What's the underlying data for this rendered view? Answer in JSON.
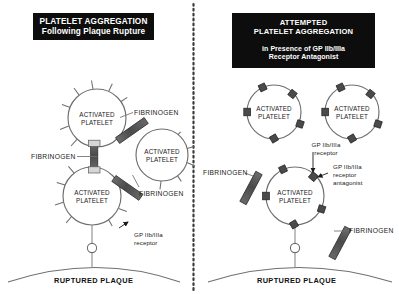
{
  "figure": {
    "divider": "vertical-dotted-line"
  },
  "panels": {
    "left": {
      "banner": {
        "line1": "PLATELET AGGREGATION",
        "line2": "Following Plaque Rupture"
      },
      "platelets": [
        {
          "id": "left-top",
          "label_line1": "ACTIVATED",
          "label_line2": "PLATELET",
          "cx": 97,
          "cy": 118,
          "r": 29
        },
        {
          "id": "left-right",
          "label_line1": "ACTIVATED",
          "label_line2": "PLATELET",
          "cx": 162,
          "cy": 155,
          "r": 26
        },
        {
          "id": "left-bottom",
          "label_line1": "ACTIVATED",
          "label_line2": "PLATELET",
          "cx": 92,
          "cy": 196,
          "r": 29
        }
      ],
      "fibrinogen_labels": [
        {
          "id": "fib-top-right",
          "text": "FIBRINOGEN",
          "x": 122,
          "y": 112
        },
        {
          "id": "fib-left",
          "text": "FIBRINOGEN",
          "x": 31,
          "y": 151
        },
        {
          "id": "fib-bottom",
          "text": "FIBRINOGEN",
          "x": 122,
          "y": 192
        }
      ],
      "receptor_label": {
        "line1": "GP IIb/IIIa",
        "line2": "receptor",
        "x": 121,
        "y": 226
      },
      "plaque_label": "RUPTURED PLAQUE"
    },
    "right": {
      "banner": {
        "line1": "ATTEMPTED",
        "line2": "PLATELET AGGREGATION",
        "sub_line1": "in Presence of GP IIb/IIIa",
        "sub_line2": "Receptor Antagonist"
      },
      "platelets": [
        {
          "id": "right-top-left",
          "label_line1": "ACTIVATED",
          "label_line2": "PLATELET",
          "cx": 274,
          "cy": 112,
          "r": 27
        },
        {
          "id": "right-top-right",
          "label_line1": "ACTIVATED",
          "label_line2": "PLATELET",
          "cx": 352,
          "cy": 112,
          "r": 27
        },
        {
          "id": "right-bottom",
          "label_line1": "ACTIVATED",
          "label_line2": "PLATELET",
          "cx": 295,
          "cy": 196,
          "r": 29
        }
      ],
      "receptor_label": {
        "line1": "GP IIb/IIIa",
        "line2": "receptor",
        "x": 302,
        "y": 144
      },
      "antagonist_label": {
        "line1": "GP IIb/IIIa",
        "line2": "receptor",
        "line3": "antagonist",
        "x": 331,
        "y": 165
      },
      "fibrinogen_labels": [
        {
          "id": "fib-right-left",
          "text": "FIBRINOGEN",
          "x": 206,
          "y": 171
        },
        {
          "id": "fib-right-lower",
          "text": "FIBRINOGEN",
          "x": 348,
          "y": 228
        }
      ],
      "plaque_label": "RUPTURED PLAQUE"
    }
  },
  "colors": {
    "banner_bg": "#0d0d0d",
    "banner_text": "#ffffff",
    "outline": "#6f6f6f",
    "fibrinogen_bar": "#595959",
    "fibrinogen_bar_edge": "#2e2e2e",
    "receptor_block": "#3a3a3a",
    "text": "#1b1b1b",
    "background": "#ffffff"
  }
}
